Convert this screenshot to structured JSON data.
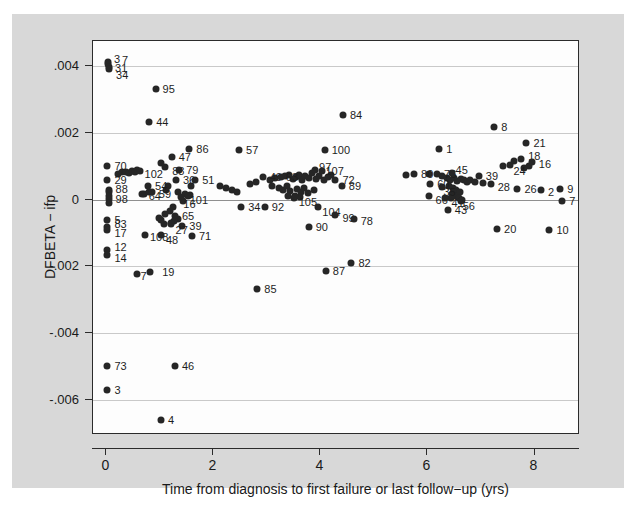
{
  "chart_data": {
    "type": "scatter",
    "title": "",
    "xlabel": "Time from diagnosis to first failure or last follow−up (yrs)",
    "ylabel": "DFBETA − ifp",
    "xlim": [
      -0.25,
      8.85
    ],
    "ylim": [
      -0.00705,
      0.00475
    ],
    "xticks": [
      "0",
      "2",
      "4",
      "6",
      "8"
    ],
    "xtickvalues": [
      0,
      2,
      4,
      6,
      8
    ],
    "yticks": [
      ".004",
      ".002",
      "0",
      "-.002",
      "-.004",
      "-.006"
    ],
    "ytickvalues": [
      0.004,
      0.002,
      0,
      -0.002,
      -0.004,
      -0.006
    ],
    "grid": "horizontal",
    "legend": "none",
    "marker": "filled-circle",
    "marker_color": "#262626",
    "points": [
      {
        "label": "3",
        "x": 0.03,
        "y": 0.00412,
        "lx": 6,
        "ly": -3
      },
      {
        "label": "7",
        "x": 0.03,
        "y": 0.00405,
        "lx": 14,
        "ly": -4
      },
      {
        "label": "31",
        "x": 0.05,
        "y": 0.00398,
        "lx": 6,
        "ly": 1
      },
      {
        "label": "34",
        "x": 0.05,
        "y": 0.00392,
        "lx": 7,
        "ly": 6
      },
      {
        "label": "95",
        "x": 0.92,
        "y": 0.00332,
        "lx": 7,
        "ly": 0
      },
      {
        "label": "44",
        "x": 0.8,
        "y": 0.00232,
        "lx": 7,
        "ly": 0
      },
      {
        "label": "84",
        "x": 4.42,
        "y": 0.00253,
        "lx": 7,
        "ly": 0
      },
      {
        "label": "8",
        "x": 7.25,
        "y": 0.00218,
        "lx": 7,
        "ly": 0
      },
      {
        "label": "21",
        "x": 7.85,
        "y": 0.0017,
        "lx": 7,
        "ly": 0
      },
      {
        "label": "86",
        "x": 1.55,
        "y": 0.00152,
        "lx": 7,
        "ly": 0
      },
      {
        "label": "57",
        "x": 2.48,
        "y": 0.00148,
        "lx": 7,
        "ly": 0
      },
      {
        "label": "100",
        "x": 4.08,
        "y": 0.00148,
        "lx": 7,
        "ly": 0
      },
      {
        "label": "1",
        "x": 6.22,
        "y": 0.00152,
        "lx": 7,
        "ly": 0
      },
      {
        "label": "47",
        "x": 1.22,
        "y": 0.00128,
        "lx": 7,
        "ly": 0
      },
      {
        "label": "18",
        "x": 7.75,
        "y": 0.00122,
        "lx": 7,
        "ly": -3
      },
      {
        "label": "16",
        "x": 7.95,
        "y": 0.00112,
        "lx": 7,
        "ly": 2
      },
      {
        "label": "24",
        "x": 7.55,
        "y": 0.00104,
        "lx": 3,
        "ly": 6
      },
      {
        "label": "70",
        "x": 0.02,
        "y": 0.001,
        "lx": 7,
        "ly": 0
      },
      {
        "label": "88",
        "x": 1.1,
        "y": 0.00098,
        "lx": 7,
        "ly": 4
      },
      {
        "label": "102",
        "x": 0.62,
        "y": 0.00085,
        "lx": 5,
        "ly": 3
      },
      {
        "label": "79",
        "x": 1.36,
        "y": 0.00088,
        "lx": 7,
        "ly": 0
      },
      {
        "label": "97",
        "x": 3.9,
        "y": 0.00088,
        "lx": 4,
        "ly": -3
      },
      {
        "label": "107",
        "x": 4.02,
        "y": 0.00085,
        "lx": 4,
        "ly": 0
      },
      {
        "label": "80",
        "x": 5.75,
        "y": 0.00078,
        "lx": 7,
        "ly": 0
      },
      {
        "label": "76",
        "x": 6.18,
        "y": 0.00078,
        "lx": 7,
        "ly": 0
      },
      {
        "label": "45",
        "x": 6.45,
        "y": 0.0008,
        "lx": 4,
        "ly": -3
      },
      {
        "label": "49",
        "x": 2.92,
        "y": 0.00068,
        "lx": 7,
        "ly": 0
      },
      {
        "label": "63",
        "x": 3.26,
        "y": 0.00068,
        "lx": 5,
        "ly": 0
      },
      {
        "label": "39",
        "x": 6.96,
        "y": 0.0007,
        "lx": 7,
        "ly": 0
      },
      {
        "label": "29",
        "x": 0.02,
        "y": 0.00058,
        "lx": 7,
        "ly": 0
      },
      {
        "label": "36",
        "x": 1.3,
        "y": 0.00058,
        "lx": 7,
        "ly": 0
      },
      {
        "label": "51",
        "x": 1.66,
        "y": 0.00058,
        "lx": 7,
        "ly": 0
      },
      {
        "label": "72",
        "x": 4.28,
        "y": 0.00058,
        "lx": 7,
        "ly": 0
      },
      {
        "label": "89",
        "x": 4.4,
        "y": 0.0004,
        "lx": 7,
        "ly": 0
      },
      {
        "label": "60",
        "x": 6.05,
        "y": 0.00048,
        "lx": 7,
        "ly": 0
      },
      {
        "label": "28",
        "x": 7.18,
        "y": 0.00048,
        "lx": 7,
        "ly": 3
      },
      {
        "label": "54",
        "x": 0.78,
        "y": 0.0004,
        "lx": 7,
        "ly": 0
      },
      {
        "label": "35",
        "x": 6.28,
        "y": 0.00038,
        "lx": 1,
        "ly": 5
      },
      {
        "label": "26",
        "x": 7.68,
        "y": 0.00032,
        "lx": 7,
        "ly": 0
      },
      {
        "label": "2",
        "x": 8.12,
        "y": 0.00028,
        "lx": 7,
        "ly": 2
      },
      {
        "label": "9",
        "x": 8.48,
        "y": 0.00032,
        "lx": 7,
        "ly": 0
      },
      {
        "label": "88b",
        "x": 0.04,
        "y": 0.00022,
        "lx": 7,
        "ly": -3
      },
      {
        "label": "98",
        "x": 0.04,
        "y": 0.00012,
        "lx": 7,
        "ly": 3
      },
      {
        "label": "64",
        "x": 0.66,
        "y": 0.00016,
        "lx": 7,
        "ly": 2
      },
      {
        "label": "59",
        "x": 0.85,
        "y": 0.00022,
        "lx": 7,
        "ly": 2
      },
      {
        "label": "101",
        "x": 1.52,
        "y": 0.0001,
        "lx": 2,
        "ly": 4
      },
      {
        "label": "16b",
        "x": 1.4,
        "y": 8e-05,
        "lx": 2,
        "ly": 7
      },
      {
        "label": "105",
        "x": 3.52,
        "y": 0.00012,
        "lx": 4,
        "ly": 6
      },
      {
        "label": "66",
        "x": 6.02,
        "y": 0.0001,
        "lx": 7,
        "ly": 4
      },
      {
        "label": "41",
        "x": 6.32,
        "y": 4e-05,
        "lx": 7,
        "ly": 5
      },
      {
        "label": "56",
        "x": 6.62,
        "y": -4e-05,
        "lx": 2,
        "ly": 5
      },
      {
        "label": "7b",
        "x": 8.52,
        "y": -5e-05,
        "lx": 7,
        "ly": 0
      },
      {
        "label": "34b",
        "x": 2.52,
        "y": -0.00022,
        "lx": 7,
        "ly": 0
      },
      {
        "label": "92",
        "x": 2.96,
        "y": -0.00022,
        "lx": 7,
        "ly": 0
      },
      {
        "label": "104",
        "x": 3.96,
        "y": -0.00022,
        "lx": 4,
        "ly": 5
      },
      {
        "label": "43",
        "x": 6.38,
        "y": -0.00032,
        "lx": 7,
        "ly": 0
      },
      {
        "label": "5",
        "x": 0.02,
        "y": -0.0006,
        "lx": 7,
        "ly": 0
      },
      {
        "label": "65",
        "x": 1.28,
        "y": -0.00048,
        "lx": 7,
        "ly": 0
      },
      {
        "label": "99",
        "x": 4.28,
        "y": -0.00046,
        "lx": 7,
        "ly": 3
      },
      {
        "label": "78",
        "x": 4.62,
        "y": -0.00058,
        "lx": 7,
        "ly": 2
      },
      {
        "label": "83",
        "x": 0.02,
        "y": -0.00082,
        "lx": 7,
        "ly": -3
      },
      {
        "label": "17",
        "x": 0.02,
        "y": -0.00092,
        "lx": 7,
        "ly": 3
      },
      {
        "label": "39b",
        "x": 1.42,
        "y": -0.00078,
        "lx": 7,
        "ly": 0
      },
      {
        "label": "27",
        "x": 1.2,
        "y": -0.00072,
        "lx": 5,
        "ly": 6
      },
      {
        "label": "90",
        "x": 3.78,
        "y": -0.00082,
        "lx": 7,
        "ly": 0
      },
      {
        "label": "20",
        "x": 7.3,
        "y": -0.00088,
        "lx": 7,
        "ly": 0
      },
      {
        "label": "10",
        "x": 8.28,
        "y": -0.0009,
        "lx": 7,
        "ly": 0
      },
      {
        "label": "108",
        "x": 0.72,
        "y": -0.00105,
        "lx": 5,
        "ly": 2
      },
      {
        "label": "48",
        "x": 1.02,
        "y": -0.00105,
        "lx": 5,
        "ly": 5
      },
      {
        "label": "71",
        "x": 1.6,
        "y": -0.0011,
        "lx": 7,
        "ly": 0
      },
      {
        "label": "12",
        "x": 0.02,
        "y": -0.00152,
        "lx": 7,
        "ly": -3
      },
      {
        "label": "14",
        "x": 0.02,
        "y": -0.00165,
        "lx": 7,
        "ly": 3
      },
      {
        "label": "82",
        "x": 4.58,
        "y": -0.0019,
        "lx": 7,
        "ly": 0
      },
      {
        "label": "87",
        "x": 4.1,
        "y": -0.00215,
        "lx": 7,
        "ly": 0
      },
      {
        "label": "19",
        "x": 0.82,
        "y": -0.00218,
        "lx": 12,
        "ly": 0
      },
      {
        "label": "7c",
        "x": 0.58,
        "y": -0.00222,
        "lx": 3,
        "ly": 2
      },
      {
        "label": "85",
        "x": 2.82,
        "y": -0.00268,
        "lx": 7,
        "ly": 0
      },
      {
        "label": "73",
        "x": 0.02,
        "y": -0.00498,
        "lx": 7,
        "ly": 0
      },
      {
        "label": "46",
        "x": 1.28,
        "y": -0.00498,
        "lx": 7,
        "ly": 0
      },
      {
        "label": "3b",
        "x": 0.02,
        "y": -0.0057,
        "lx": 7,
        "ly": 0
      },
      {
        "label": "4",
        "x": 1.02,
        "y": -0.0066,
        "lx": 7,
        "ly": 0
      }
    ],
    "cluster_points": [
      {
        "x": 0.3,
        "y": 0.00082
      },
      {
        "x": 0.36,
        "y": 0.00084
      },
      {
        "x": 0.42,
        "y": 0.0008
      },
      {
        "x": 0.48,
        "y": 0.00086
      },
      {
        "x": 0.54,
        "y": 0.00082
      },
      {
        "x": 0.58,
        "y": 0.00088
      },
      {
        "x": 1.02,
        "y": 0.0011
      },
      {
        "x": 0.04,
        "y": 0.0003
      },
      {
        "x": 0.04,
        "y": 2e-05
      },
      {
        "x": 0.04,
        "y": -0.0001
      },
      {
        "x": 1.16,
        "y": 0.00042
      },
      {
        "x": 1.12,
        "y": 0.0003
      },
      {
        "x": 1.34,
        "y": 0.00022
      },
      {
        "x": 1.46,
        "y": 0.00016
      },
      {
        "x": 1.56,
        "y": 0.00014
      },
      {
        "x": 1.44,
        "y": -4e-05
      },
      {
        "x": 1.24,
        "y": -0.00022
      },
      {
        "x": 1.18,
        "y": -0.00034
      },
      {
        "x": 1.1,
        "y": -0.00044
      },
      {
        "x": 1.34,
        "y": -0.00058
      },
      {
        "x": 1.26,
        "y": -0.00064
      },
      {
        "x": 1.2,
        "y": -0.0007
      },
      {
        "x": 1.08,
        "y": -0.00072
      },
      {
        "x": 1.02,
        "y": -0.00062
      },
      {
        "x": 0.98,
        "y": -0.00056
      },
      {
        "x": 3.06,
        "y": 0.0006
      },
      {
        "x": 3.16,
        "y": 0.00066
      },
      {
        "x": 3.34,
        "y": 0.0007
      },
      {
        "x": 3.42,
        "y": 0.00074
      },
      {
        "x": 3.48,
        "y": 0.00062
      },
      {
        "x": 3.54,
        "y": 0.00068
      },
      {
        "x": 3.6,
        "y": 0.00074
      },
      {
        "x": 3.66,
        "y": 0.00058
      },
      {
        "x": 3.72,
        "y": 0.00072
      },
      {
        "x": 3.78,
        "y": 0.00066
      },
      {
        "x": 3.84,
        "y": 0.0008
      },
      {
        "x": 3.92,
        "y": 0.00062
      },
      {
        "x": 3.98,
        "y": 0.00072
      },
      {
        "x": 4.06,
        "y": 0.00058
      },
      {
        "x": 4.14,
        "y": 0.00068
      },
      {
        "x": 4.2,
        "y": 0.00074
      },
      {
        "x": 3.1,
        "y": 0.00042
      },
      {
        "x": 3.22,
        "y": 0.00036
      },
      {
        "x": 3.3,
        "y": 0.0003
      },
      {
        "x": 3.38,
        "y": 0.0004
      },
      {
        "x": 3.44,
        "y": 0.00026
      },
      {
        "x": 3.56,
        "y": 0.00032
      },
      {
        "x": 3.64,
        "y": 0.00024
      },
      {
        "x": 3.7,
        "y": 0.00034
      },
      {
        "x": 3.76,
        "y": 0.0002
      },
      {
        "x": 3.88,
        "y": 0.00028
      },
      {
        "x": 3.4,
        "y": 0.0001
      },
      {
        "x": 3.5,
        "y": 4e-05
      },
      {
        "x": 3.62,
        "y": 8e-05
      },
      {
        "x": 2.12,
        "y": 0.0004
      },
      {
        "x": 2.24,
        "y": 0.00036
      },
      {
        "x": 2.34,
        "y": 0.0003
      },
      {
        "x": 2.44,
        "y": 0.00024
      },
      {
        "x": 6.28,
        "y": 0.0007
      },
      {
        "x": 6.36,
        "y": 0.00066
      },
      {
        "x": 6.42,
        "y": 0.0006
      },
      {
        "x": 6.5,
        "y": 0.00064
      },
      {
        "x": 6.56,
        "y": 0.00056
      },
      {
        "x": 6.62,
        "y": 0.00062
      },
      {
        "x": 6.68,
        "y": 0.00058
      },
      {
        "x": 6.74,
        "y": 0.00052
      },
      {
        "x": 6.8,
        "y": 0.00058
      },
      {
        "x": 6.88,
        "y": 0.00054
      },
      {
        "x": 6.4,
        "y": 0.0004
      },
      {
        "x": 6.48,
        "y": 0.00034
      },
      {
        "x": 6.54,
        "y": 0.00028
      },
      {
        "x": 6.6,
        "y": 0.00022
      },
      {
        "x": 6.46,
        "y": 0.00016
      },
      {
        "x": 6.52,
        "y": 0.0001
      },
      {
        "x": 6.58,
        "y": 4e-05
      },
      {
        "x": 6.64,
        "y": 0.0
      },
      {
        "x": 6.44,
        "y": 4e-05
      },
      {
        "x": 5.6,
        "y": 0.00074
      },
      {
        "x": 6.02,
        "y": 0.00076
      },
      {
        "x": 7.04,
        "y": 0.0005
      },
      {
        "x": 7.42,
        "y": 0.001
      },
      {
        "x": 7.62,
        "y": 0.00116
      },
      {
        "x": 7.9,
        "y": 0.001
      },
      {
        "x": 7.8,
        "y": 0.00094
      },
      {
        "x": 0.7,
        "y": 0.00018
      },
      {
        "x": 0.8,
        "y": 0.00022
      },
      {
        "x": 2.68,
        "y": 0.00048
      },
      {
        "x": 2.8,
        "y": 0.00052
      },
      {
        "x": 1.58,
        "y": 0.00042
      },
      {
        "x": 0.22,
        "y": 0.00078
      }
    ]
  },
  "axes": {
    "x_tick_labels": [
      "0",
      "2",
      "4",
      "6",
      "8"
    ],
    "y_tick_labels": [
      ".004",
      ".002",
      "0",
      "-.002",
      "-.004",
      "-.006"
    ]
  }
}
